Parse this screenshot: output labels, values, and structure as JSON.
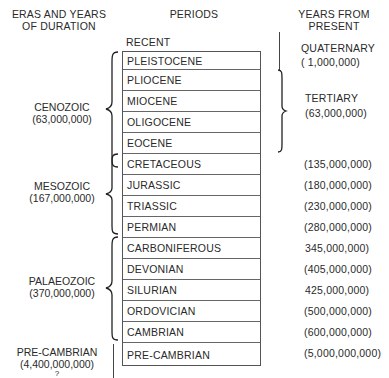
{
  "headers": {
    "eras": [
      "ERAS AND YEARS",
      "OF DURATION"
    ],
    "periods": "PERIODS",
    "years": [
      "YEARS FROM",
      "PRESENT"
    ]
  },
  "recent_label": "RECENT",
  "eras": [
    {
      "name": "CENOZOIC",
      "duration": "(63,000,000)"
    },
    {
      "name": "MESOZOIC",
      "duration": "(167,000,000)"
    },
    {
      "name": "PALAEOZOIC",
      "duration": "(370,000,000)"
    },
    {
      "name": "PRE-CAMBRIAN",
      "duration": "(4,400,000,000)",
      "note": "?"
    }
  ],
  "periods": [
    "PLEISTOCENE",
    "PLIOCENE",
    "MIOCENE",
    "OLIGOCENE",
    "EOCENE",
    "CRETACEOUS",
    "JURASSIC",
    "TRIASSIC",
    "PERMIAN",
    "CARBONIFEROUS",
    "DEVONIAN",
    "SILURIAN",
    "ORDOVICIAN",
    "CAMBRIAN",
    "PRE-CAMBRIAN"
  ],
  "cenozoic_subdivisions": [
    {
      "name": "QUATERNARY",
      "years": "( 1,000,000)"
    },
    {
      "name": "TERTIARY",
      "years": "(63,000,000)"
    }
  ],
  "years_from_present": [
    "(135,000,000)",
    "(180,000,000)",
    "(230,000,000)",
    "(280,000,000)",
    "345,000,000)",
    "(405,000,000)",
    "425,000,000)",
    "(500,000,000)",
    "(600,000,000)",
    "(5,000,000,000)"
  ]
}
